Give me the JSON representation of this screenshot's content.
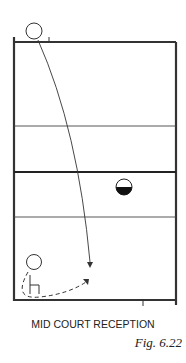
{
  "diagram": {
    "caption": "MID COURT RECEPTION",
    "figure_label": "Fig. 6.22",
    "colors": {
      "line": "#333333",
      "background": "#ffffff",
      "fill": "#111111"
    },
    "elements": [
      {
        "type": "court-outline"
      },
      {
        "type": "court-line",
        "label": "attack line far"
      },
      {
        "type": "net"
      },
      {
        "type": "court-line",
        "label": "attack line near"
      },
      {
        "type": "player",
        "label": "server (circle) at top baseline"
      },
      {
        "type": "ball-path",
        "label": "solid curved arrow from server to mid-court"
      },
      {
        "type": "player",
        "label": "half-filled circle at net side"
      },
      {
        "type": "player",
        "label": "receiver (circle with chair) bottom-left"
      },
      {
        "type": "movement-path",
        "label": "dashed curved arrow from receiver toward ball"
      }
    ]
  }
}
